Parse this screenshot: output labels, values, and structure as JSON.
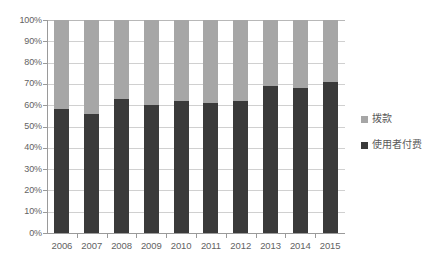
{
  "chart_data": {
    "type": "bar",
    "subtype": "100% stacked column",
    "title": "",
    "xlabel": "",
    "ylabel": "",
    "categories": [
      "2006",
      "2007",
      "2008",
      "2009",
      "2010",
      "2011",
      "2012",
      "2013",
      "2014",
      "2015"
    ],
    "series": [
      {
        "name": "使用者付费",
        "color": "#3a3a3a",
        "values": [
          58,
          56,
          63,
          60,
          62,
          61,
          62,
          69,
          68,
          71
        ]
      },
      {
        "name": "拨款",
        "color": "#a6a6a6",
        "values": [
          42,
          44,
          37,
          40,
          38,
          39,
          38,
          31,
          32,
          29
        ]
      }
    ],
    "ylim": [
      0,
      100
    ],
    "ytick_values": [
      0,
      10,
      20,
      30,
      40,
      50,
      60,
      70,
      80,
      90,
      100
    ],
    "ytick_labels": [
      "0%",
      "10%",
      "20%",
      "30%",
      "40%",
      "50%",
      "60%",
      "70%",
      "80%",
      "90%",
      "100%"
    ],
    "grid": true,
    "grid_axis": "y",
    "legend_position": "right",
    "legend_entries": [
      "拨款",
      "使用者付费"
    ]
  },
  "axes": {
    "y_labels": [
      "100%",
      "90%",
      "80%",
      "70%",
      "60%",
      "50%",
      "40%",
      "30%",
      "20%",
      "10%",
      "0%"
    ],
    "x_labels": [
      "2006",
      "2007",
      "2008",
      "2009",
      "2010",
      "2011",
      "2012",
      "2013",
      "2014",
      "2015"
    ]
  },
  "legend": {
    "items": [
      {
        "label": "拨款",
        "color": "#a6a6a6"
      },
      {
        "label": "使用者付费",
        "color": "#3a3a3a"
      }
    ]
  }
}
